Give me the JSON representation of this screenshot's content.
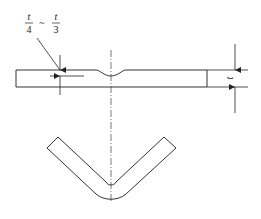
{
  "diagram": {
    "title": "",
    "labels": {
      "groove_depth_num1": "t",
      "groove_depth_den1": "4",
      "groove_depth_sep": "~",
      "groove_depth_num2": "t",
      "groove_depth_den2": "3",
      "thickness": "t"
    },
    "colors": {
      "line": "#333333",
      "background": "#ffffff"
    }
  }
}
